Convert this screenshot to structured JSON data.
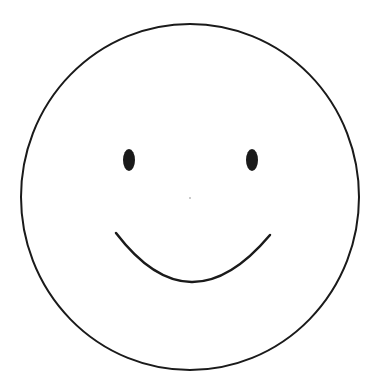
{
  "image": {
    "description": "Smiley face line drawing",
    "background": "#ffffff",
    "stroke_color": "#1a1a1a"
  },
  "face": {
    "label": "smiley-face",
    "circle": {
      "cx": 190,
      "cy": 197,
      "rx": 169,
      "ry": 173,
      "stroke_width": 2
    },
    "left_eye": {
      "cx": 129,
      "cy": 160,
      "rx": 6,
      "ry": 11
    },
    "right_eye": {
      "cx": 252,
      "cy": 160,
      "rx": 6,
      "ry": 11
    },
    "nose_dot": {
      "cx": 190,
      "cy": 198,
      "r": 0.8
    },
    "mouth": {
      "x1": 116,
      "y1": 233,
      "cx": 190,
      "cy": 330,
      "x2": 270,
      "y2": 235,
      "stroke_width": 2.5
    }
  }
}
